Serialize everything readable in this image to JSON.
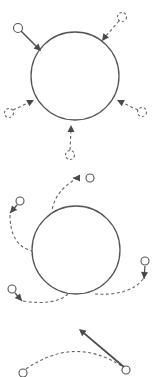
{
  "canvas": {
    "width": 159,
    "height": 377,
    "background": "#ffffff"
  },
  "colors": {
    "stroke": "#555555",
    "arrow": "#4a4a4a",
    "dashed": "#666666"
  },
  "panels": [
    {
      "id": "panel-converging",
      "big_circle": {
        "cx": 75,
        "cy": 76,
        "r": 44
      },
      "particles": [
        {
          "name": "particle-top-left",
          "style": "solid",
          "cx": 18,
          "cy": 28,
          "r": 4.5,
          "path": "M 21 31 L 38 48",
          "tip": [
            41,
            51
          ],
          "from": [
            38,
            48
          ],
          "path_style": "solid"
        },
        {
          "name": "particle-top-right",
          "style": "dashed",
          "cx": 122,
          "cy": 17,
          "r": 4.5,
          "path": "M 119 21 L 105 37",
          "tip": [
            102,
            41
          ],
          "from": [
            105,
            37
          ],
          "path_style": "dashed"
        },
        {
          "name": "particle-left",
          "style": "dashed",
          "cx": 9,
          "cy": 113,
          "r": 4.5,
          "path": "M 13 110 L 30 102",
          "tip": [
            34,
            100
          ],
          "from": [
            30,
            102
          ],
          "path_style": "dashed"
        },
        {
          "name": "particle-right",
          "style": "dashed",
          "cx": 142,
          "cy": 112,
          "r": 4.5,
          "path": "M 138 110 L 121 102",
          "tip": [
            117,
            100
          ],
          "from": [
            121,
            102
          ],
          "path_style": "dashed"
        },
        {
          "name": "particle-bottom",
          "style": "dashed",
          "cx": 70,
          "cy": 155,
          "r": 4.5,
          "path": "M 70 150 L 71 129",
          "tip": [
            71,
            125
          ],
          "from": [
            71,
            129
          ],
          "path_style": "dashed"
        }
      ]
    },
    {
      "id": "panel-deflecting",
      "big_circle": {
        "cx": 76,
        "cy": 250,
        "r": 44
      },
      "particles": [
        {
          "name": "particle-upper-right",
          "style": "solid",
          "cx": 90,
          "cy": 178,
          "r": 4,
          "path": "M 78 178 Q 55 190 52 211",
          "tip": [
            73,
            178
          ],
          "from": [
            78,
            178
          ],
          "path_style": "dashed"
        },
        {
          "name": "particle-upper-left",
          "style": "solid",
          "cx": 20,
          "cy": 201,
          "r": 4,
          "path": "M 10 215 Q 10 245 32 251",
          "tip": [
            10,
            213
          ],
          "from": [
            17,
            205
          ],
          "path_style": "dashed"
        },
        {
          "name": "particle-lower-left",
          "style": "solid",
          "cx": 12,
          "cy": 289,
          "r": 4,
          "path": "M 23 301 Q 55 306 68 294",
          "tip": [
            22,
            301
          ],
          "from": [
            15,
            293
          ],
          "path_style": "dashed"
        },
        {
          "name": "particle-right",
          "style": "solid",
          "cx": 145,
          "cy": 261,
          "r": 4,
          "path": "M 143 279 Q 130 296 95 294",
          "tip": [
            144,
            279
          ],
          "from": [
            145,
            266
          ],
          "path_style": "dashed"
        }
      ]
    },
    {
      "id": "panel-recoil",
      "arc": {
        "path": "M 26 369 Q 75 335 123 367"
      },
      "particles": [
        {
          "name": "particle-left-end",
          "style": "solid",
          "cx": 23,
          "cy": 373,
          "r": 4
        },
        {
          "name": "particle-right-end",
          "style": "solid",
          "cx": 126,
          "cy": 370,
          "r": 4
        }
      ],
      "arrow": {
        "from": [
          124,
          367
        ],
        "tip": [
          79,
          329
        ]
      }
    }
  ]
}
